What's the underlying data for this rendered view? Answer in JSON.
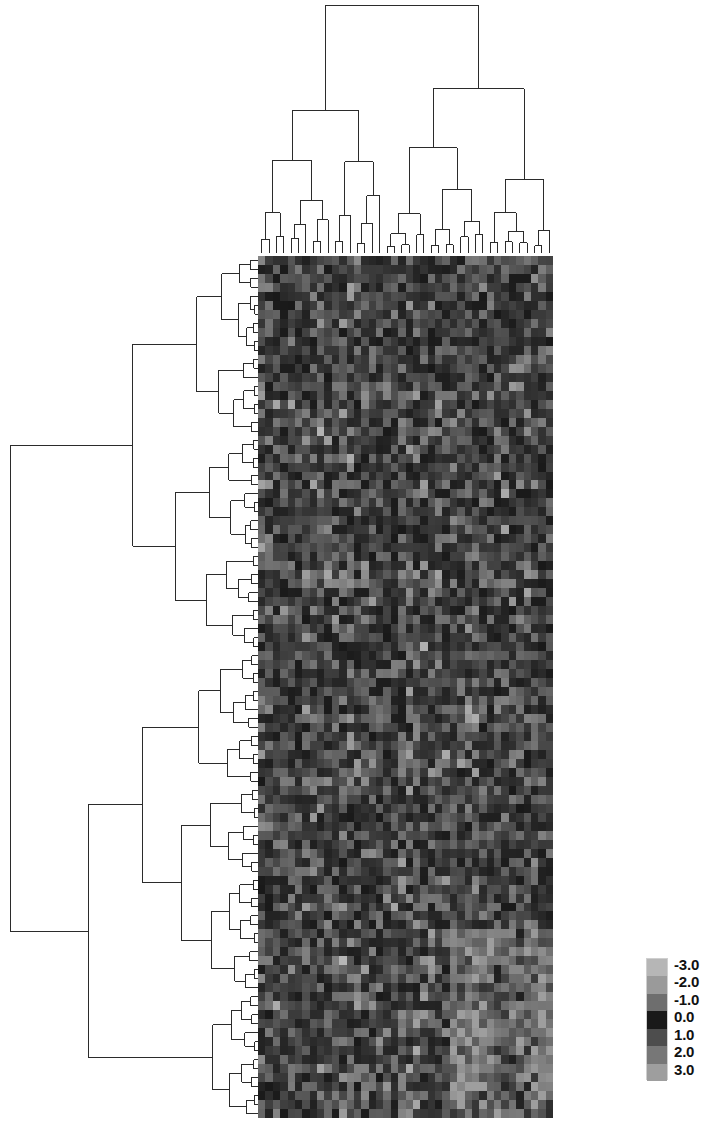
{
  "figure": {
    "width": 718,
    "height": 1129,
    "background_color": "#ffffff"
  },
  "legend": {
    "name": "color-scale-legend",
    "orientation": "vertical",
    "tick_labels": [
      "-3.0",
      "-2.0",
      "-1.0",
      "0.0",
      "1.0",
      "2.0",
      "3.0"
    ],
    "swatch_colors": [
      "#b6b6b6",
      "#9a9a9a",
      "#6e6e6e",
      "#191919",
      "#4d4d4d",
      "#777777",
      "#9e9e9e"
    ],
    "min": -3.0,
    "max": 3.0,
    "step": 1.0
  },
  "heatmap": {
    "name": "expression-heatmap",
    "rows": 96,
    "cols": 40,
    "x": 258,
    "y": 256,
    "width": 295,
    "height": 862,
    "colormap": "grayscale-diverging",
    "value_range": [
      -3.0,
      3.0
    ]
  },
  "column_dendrogram": {
    "name": "column-dendrogram",
    "leaves": 40,
    "orientation": "top",
    "x": 258,
    "y": 5,
    "width": 295,
    "height": 248,
    "line_color": "#2b2b2b"
  },
  "row_dendrogram": {
    "name": "row-dendrogram",
    "leaves": 96,
    "orientation": "left",
    "x": 10,
    "y": 256,
    "width": 248,
    "height": 862,
    "line_color": "#2b2b2b"
  },
  "chart_data": {
    "type": "heatmap",
    "subtitle": "",
    "xlabel": "",
    "ylabel": "",
    "colorbar_label": "",
    "colorbar_ticks": [
      -3.0,
      -2.0,
      -1.0,
      0.0,
      1.0,
      2.0,
      3.0
    ],
    "colorbar_tick_labels": [
      "-3.0",
      "-2.0",
      "-1.0",
      "0.0",
      "1.0",
      "2.0",
      "3.0"
    ],
    "colorscale": "grayscale",
    "zmin": -3.0,
    "zmax": 3.0,
    "n_rows": 96,
    "n_cols": 40,
    "row_tick_labels": [],
    "col_tick_labels": [],
    "grid": false,
    "legend_position": "bottom-right",
    "row_dendrogram": true,
    "col_dendrogram": true,
    "annotations": []
  }
}
